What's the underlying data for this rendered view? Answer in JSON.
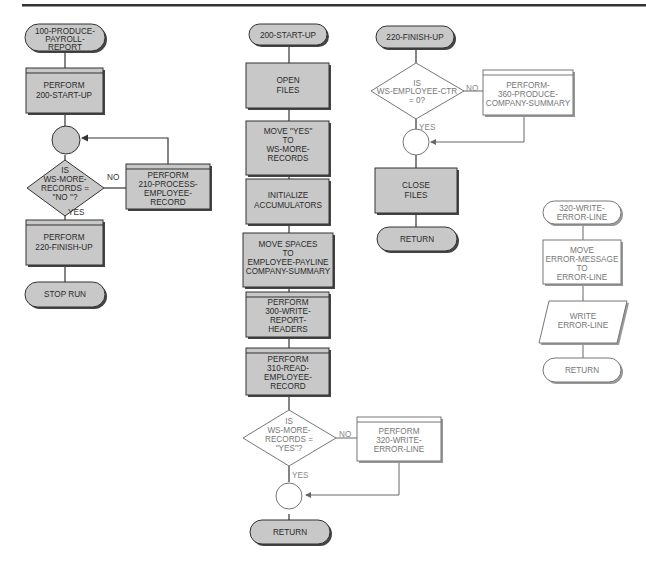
{
  "diagram": {
    "type": "flowchart",
    "header_rule": true,
    "colors": {
      "shaded_fill": "#c8c8c8",
      "outline": "#333333",
      "light_outline": "#777777",
      "background": "#ffffff"
    },
    "col1": {
      "start": [
        "100-PRODUCE-",
        "PAYROLL-",
        "REPORT"
      ],
      "perform_startup": [
        "PERFORM",
        "200-START-UP"
      ],
      "decision": [
        "IS",
        "WS-MORE-",
        "RECORDS =",
        "\"NO \"?"
      ],
      "no_label": "NO",
      "yes_label": "YES",
      "perform_process": [
        "PERFORM",
        "210-PROCESS-",
        "EMPLOYEE-",
        "RECORD"
      ],
      "perform_finish": [
        "PERFORM",
        "220-FINISH-UP"
      ],
      "end": "STOP RUN"
    },
    "col2": {
      "start": "200-START-UP",
      "open_files": [
        "OPEN",
        "FILES"
      ],
      "move_yes": [
        "MOVE \"YES\"",
        "TO",
        "WS-MORE-",
        "RECORDS"
      ],
      "initialize": [
        "INITIALIZE",
        "ACCUMULATORS"
      ],
      "move_spaces": [
        "MOVE SPACES",
        "TO",
        "EMPLOYEE-PAYLINE",
        "COMPANY-SUMMARY"
      ],
      "perform_headers": [
        "PERFORM",
        "300-WRITE-",
        "REPORT-",
        "HEADERS"
      ],
      "perform_read": [
        "PERFORM",
        "310-READ-",
        "EMPLOYEE-",
        "RECORD"
      ],
      "decision": [
        "IS",
        "WS-MORE-",
        "RECORDS =",
        "\"YES\"?"
      ],
      "no_label": "NO",
      "yes_label": "YES",
      "perform_error": [
        "PERFORM",
        "320-WRITE-",
        "ERROR-LINE"
      ],
      "end": "RETURN"
    },
    "col3": {
      "start": "220-FINISH-UP",
      "decision": [
        "IS",
        "WS-EMPLOYEE-CTR",
        "= 0?"
      ],
      "no_label": "NO",
      "yes_label": "YES",
      "perform_summary": [
        "PERFORM-",
        "360-PRODUCE-",
        "COMPANY-SUMMARY"
      ],
      "close_files": [
        "CLOSE",
        "FILES"
      ],
      "end": "RETURN"
    },
    "col4": {
      "start": [
        "320-WRITE-",
        "ERROR-LINE"
      ],
      "move_error": [
        "MOVE",
        "ERROR-MESSAGE",
        "TO",
        "ERROR-LINE"
      ],
      "write_error": [
        "WRITE",
        "ERROR-LINE"
      ],
      "end": "RETURN"
    }
  }
}
